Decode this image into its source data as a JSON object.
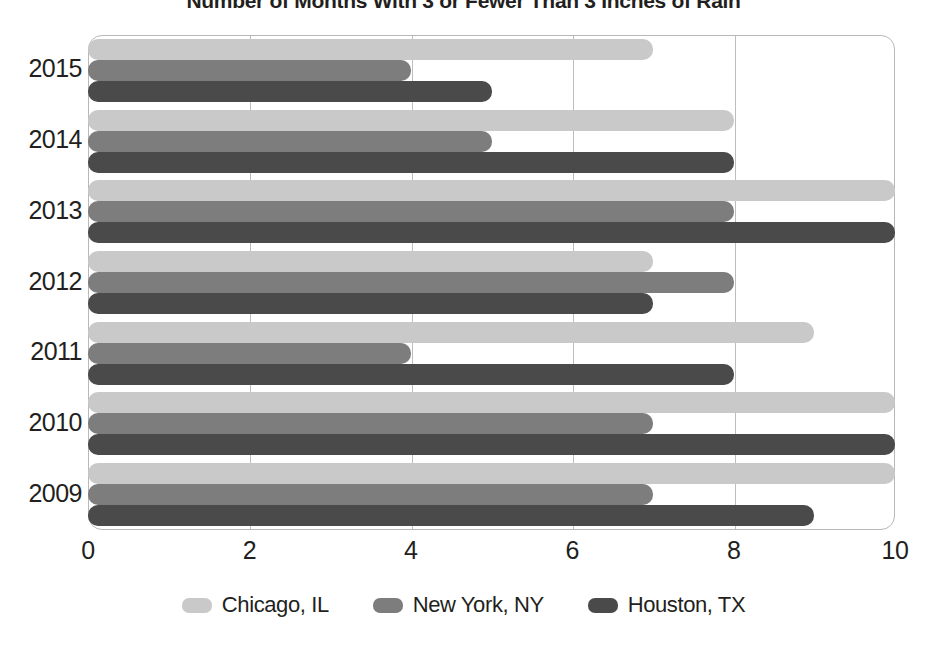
{
  "chart_data": {
    "type": "bar",
    "orientation": "horizontal",
    "title": "Number of Months With 3 or Fewer Than 3 Inches of Rain",
    "xlabel": "",
    "ylabel": "",
    "categories": [
      "2015",
      "2014",
      "2013",
      "2012",
      "2011",
      "2010",
      "2009"
    ],
    "xlim": [
      0,
      10
    ],
    "xticks": [
      "0",
      "2",
      "4",
      "6",
      "8",
      "10"
    ],
    "xtick_values": [
      0,
      2,
      4,
      6,
      8,
      10
    ],
    "grid": true,
    "legend_position": "bottom",
    "series": [
      {
        "name": "Chicago, IL",
        "color": "#c9c9c9",
        "values": [
          7,
          8,
          10,
          7,
          9,
          10,
          10
        ]
      },
      {
        "name": "New York, NY",
        "color": "#7d7d7d",
        "values": [
          4,
          5,
          8,
          8,
          4,
          7,
          7
        ]
      },
      {
        "name": "Houston, TX",
        "color": "#4a4a4a",
        "values": [
          5,
          8,
          10,
          7,
          8,
          10,
          9
        ]
      }
    ]
  },
  "colors": {
    "chicago": "#c9c9c9",
    "new_york": "#7d7d7d",
    "houston": "#4a4a4a",
    "grid": "#bdbdbd",
    "frame": "#b8b8b8",
    "text": "#231f20"
  }
}
